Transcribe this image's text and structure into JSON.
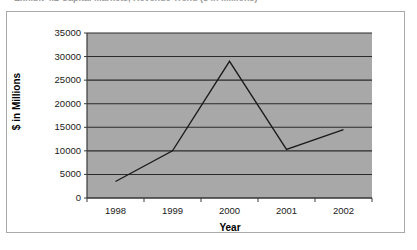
{
  "caption": {
    "text": "Exhibit 4.2    Capital Markets, Revenue Trend ($ in Millions)"
  },
  "chart_data": {
    "type": "line",
    "title": "",
    "xlabel": "Year",
    "ylabel": "$ in Millions",
    "categories": [
      "1998",
      "1999",
      "2000",
      "2001",
      "2002"
    ],
    "values": [
      3500,
      10000,
      29000,
      10300,
      14500
    ],
    "series": [
      {
        "name": "Revenue",
        "values": [
          3500,
          10000,
          29000,
          10300,
          14500
        ]
      }
    ],
    "ylim": [
      0,
      35000
    ],
    "ytick_step": 5000,
    "yticks": [
      "0",
      "5000",
      "10000",
      "15000",
      "20000",
      "25000",
      "30000",
      "35000"
    ],
    "xticks": [
      "1998",
      "1999",
      "2000",
      "2001",
      "2002"
    ],
    "grid": true,
    "grid_axis": "y",
    "legend": false,
    "legend_position": "none",
    "plot_background": "#a8a8a8",
    "line_color": "#1a1a1a",
    "grid_color": "#2b2b2b",
    "axis_color": "#3a3a3a"
  }
}
